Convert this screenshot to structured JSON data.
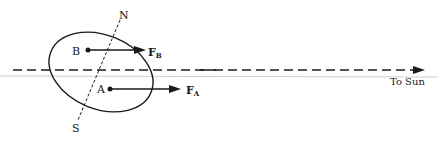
{
  "diagram": {
    "labels": {
      "north": "N",
      "south": "S",
      "point_b": "B",
      "point_a": "A",
      "force_b_main": "F",
      "force_b_sub": "B",
      "force_a_main": "F",
      "force_a_sub": "A",
      "direction": "To Sun"
    },
    "colors": {
      "ink": "#1a1a1a",
      "baseline": "#cfcfcf",
      "background": "#ffffff"
    }
  }
}
